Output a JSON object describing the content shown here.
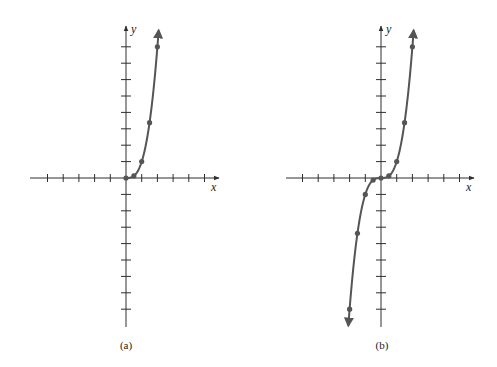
{
  "chart_data": [
    {
      "type": "line",
      "panel_label": "(a)",
      "xlabel": "x",
      "ylabel": "y",
      "function": "y = x^3, x >= 0",
      "xlim": [
        -6,
        6
      ],
      "ylim": [
        -9,
        9
      ],
      "grid": false,
      "tick_spacing": 1,
      "x": [
        0,
        0.5,
        1,
        1.5,
        2
      ],
      "y": [
        0,
        0.125,
        1,
        3.375,
        8
      ],
      "arrow_ends": [
        "upper-right"
      ],
      "curve_color": "#555555"
    },
    {
      "type": "line",
      "panel_label": "(b)",
      "xlabel": "x",
      "ylabel": "y",
      "function": "y = x^3",
      "xlim": [
        -6,
        6
      ],
      "ylim": [
        -9,
        9
      ],
      "grid": false,
      "tick_spacing": 1,
      "x": [
        -2,
        -1.5,
        -1,
        -0.5,
        0,
        0.5,
        1,
        1.5,
        2
      ],
      "y": [
        -8,
        -3.375,
        -1,
        -0.125,
        0,
        0.125,
        1,
        3.375,
        8
      ],
      "arrow_ends": [
        "lower-left",
        "upper-right"
      ],
      "curve_color": "#555555"
    }
  ],
  "panels": [
    {
      "caption": "(a)",
      "x_label": "x",
      "y_label": "y"
    },
    {
      "caption": "(b)",
      "x_label": "x",
      "y_label": "y"
    }
  ],
  "colors": {
    "axis": "#2e2e2e",
    "curve": "#555555",
    "background": "#ffffff"
  }
}
